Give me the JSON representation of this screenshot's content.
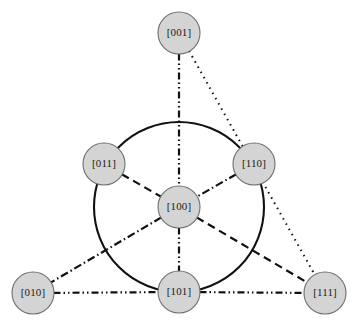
{
  "figure": {
    "title": "",
    "background_color": "#ffffff",
    "node_fill": "#d4d4d4",
    "node_stroke": "#6e6e6e",
    "line_color": "#111111"
  },
  "nodes": [
    {
      "id": "001",
      "label": "[001]",
      "cx": 179,
      "cy": 33,
      "r": 21
    },
    {
      "id": "011",
      "label": "[011]",
      "cx": 104,
      "cy": 164,
      "r": 21
    },
    {
      "id": "110",
      "label": "[110]",
      "cx": 254,
      "cy": 164,
      "r": 21
    },
    {
      "id": "100",
      "label": "[100]",
      "cx": 179,
      "cy": 207,
      "r": 21
    },
    {
      "id": "010",
      "label": "[010]",
      "cx": 33,
      "cy": 293,
      "r": 21
    },
    {
      "id": "101",
      "label": "[101]",
      "cx": 179,
      "cy": 292,
      "r": 21
    },
    {
      "id": "111",
      "label": "[111]",
      "cx": 325,
      "cy": 293,
      "r": 21
    }
  ],
  "hub_circle": {
    "cx": 179,
    "cy": 207,
    "r": 85,
    "style": "solid"
  },
  "edges": [
    {
      "id": "e-001-100",
      "from": "001",
      "to": "100",
      "style": "dash-dot-dot",
      "dasharray": "7,3,1.5,3,1.5,3"
    },
    {
      "id": "e-100-101",
      "from": "100",
      "to": "101",
      "style": "dash-dot-dot",
      "dasharray": "7,3,1.5,3,1.5,3"
    },
    {
      "id": "e-001-111",
      "from": "001",
      "to": "111",
      "style": "dotted",
      "dasharray": "1.5,4.5"
    },
    {
      "id": "e-011-100",
      "from": "011",
      "to": "100",
      "style": "dashed",
      "dasharray": "8,5"
    },
    {
      "id": "e-100-111",
      "from": "100",
      "to": "111",
      "style": "dashed",
      "dasharray": "8,5"
    },
    {
      "id": "e-110-100",
      "from": "110",
      "to": "100",
      "style": "dash-dot",
      "dasharray": "8,3,1.5,3"
    },
    {
      "id": "e-100-010",
      "from": "100",
      "to": "010",
      "style": "dash-dot",
      "dasharray": "8,3,1.5,3"
    },
    {
      "id": "e-010-101",
      "from": "010",
      "to": "101",
      "style": "dash-dot-dot",
      "dasharray": "7,3,1.5,3,1.5,3"
    },
    {
      "id": "e-101-111",
      "from": "101",
      "to": "111",
      "style": "dash-dot-dot",
      "dasharray": "7,3,1.5,3,1.5,3"
    }
  ]
}
